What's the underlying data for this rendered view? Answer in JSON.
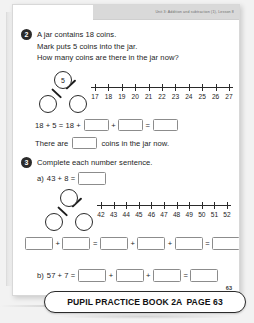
{
  "header": {
    "running_head": "Unit 3: Addition and subtraction (1), Lesson 8"
  },
  "page": {
    "number": "63"
  },
  "questions": [
    {
      "number": "2",
      "lines": [
        "A jar contains 18 coins.",
        "Mark puts 5 coins into the jar.",
        "How many coins are there in the jar now?"
      ],
      "part_whole": {
        "whole": "5",
        "part_left": "",
        "part_right": ""
      },
      "number_line": {
        "ticks": [
          "17",
          "18",
          "19",
          "20",
          "21",
          "22",
          "23",
          "24",
          "25",
          "26",
          "27"
        ]
      },
      "equation": {
        "prefix": "18 + 5 = 18 +",
        "op1": "+",
        "op2": "=",
        "boxes": [
          "",
          "",
          ""
        ]
      },
      "sentence": {
        "before": "There are",
        "after": "coins in the jar now.",
        "box": ""
      }
    },
    {
      "number": "3",
      "lines": [
        "Complete each number sentence."
      ],
      "part_a": {
        "label": "a)",
        "prefix": "43 + 8 =",
        "box": ""
      },
      "part_whole": {
        "whole": "",
        "part_left": "",
        "part_right": ""
      },
      "number_line": {
        "ticks": [
          "42",
          "43",
          "44",
          "45",
          "46",
          "47",
          "48",
          "49",
          "50",
          "51",
          "52"
        ]
      },
      "box_equation": {
        "boxes": [
          "",
          "",
          "",
          "",
          "",
          ""
        ],
        "ops": [
          "+",
          "=",
          "+",
          "+",
          "="
        ]
      },
      "part_b": {
        "label": "b)",
        "prefix": "57 + 7 =",
        "ops": [
          "+",
          "+",
          "="
        ],
        "boxes": [
          "",
          "",
          "",
          ""
        ]
      }
    }
  ],
  "banner": {
    "title": "PUPIL PRACTICE BOOK 2A",
    "page_label": "PAGE 63"
  }
}
